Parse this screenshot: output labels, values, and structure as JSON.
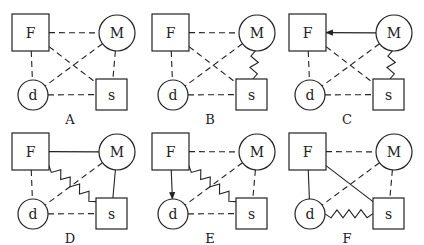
{
  "colors": {
    "ink": "#222222",
    "background": "#ffffff"
  },
  "legend": {
    "edge_styles": [
      "dashed",
      "solid",
      "zigzag",
      "arrow"
    ]
  },
  "nodes": {
    "F": {
      "label": "F",
      "shape": "square",
      "x": 12,
      "y": 14,
      "w": 37,
      "h": 37
    },
    "M": {
      "label": "M",
      "shape": "circle",
      "cx": 117,
      "cy": 33,
      "r": 18
    },
    "d": {
      "label": "d",
      "shape": "circle",
      "cx": 33,
      "cy": 95,
      "r": 15
    },
    "s": {
      "label": "s",
      "shape": "square",
      "x": 96,
      "y": 79,
      "w": 31,
      "h": 31
    }
  },
  "panels": [
    {
      "id": "A",
      "label": "A",
      "dx": 0,
      "dy": 0,
      "edges": [
        {
          "from": "F",
          "to": "M",
          "style": "dashed"
        },
        {
          "from": "F",
          "to": "d",
          "style": "dashed"
        },
        {
          "from": "F",
          "to": "s",
          "style": "dashed"
        },
        {
          "from": "M",
          "to": "d",
          "style": "dashed"
        },
        {
          "from": "M",
          "to": "s",
          "style": "dashed"
        },
        {
          "from": "d",
          "to": "s",
          "style": "dashed"
        }
      ]
    },
    {
      "id": "B",
      "label": "B",
      "dx": 140,
      "dy": 0,
      "edges": [
        {
          "from": "F",
          "to": "M",
          "style": "dashed"
        },
        {
          "from": "F",
          "to": "d",
          "style": "dashed"
        },
        {
          "from": "F",
          "to": "s",
          "style": "dashed"
        },
        {
          "from": "M",
          "to": "d",
          "style": "dashed"
        },
        {
          "from": "M",
          "to": "s",
          "style": "zigzag"
        },
        {
          "from": "d",
          "to": "s",
          "style": "dashed"
        }
      ]
    },
    {
      "id": "C",
      "label": "C",
      "dx": 277,
      "dy": 0,
      "edges": [
        {
          "from": "M",
          "to": "F",
          "style": "arrow"
        },
        {
          "from": "F",
          "to": "d",
          "style": "dashed"
        },
        {
          "from": "F",
          "to": "s",
          "style": "dashed"
        },
        {
          "from": "M",
          "to": "d",
          "style": "dashed"
        },
        {
          "from": "M",
          "to": "s",
          "style": "zigzag"
        },
        {
          "from": "d",
          "to": "s",
          "style": "dashed"
        }
      ]
    },
    {
      "id": "D",
      "label": "D",
      "dx": 0,
      "dy": 119,
      "edges": [
        {
          "from": "F",
          "to": "M",
          "style": "solid"
        },
        {
          "from": "F",
          "to": "d",
          "style": "dashed"
        },
        {
          "from": "F",
          "to": "s",
          "style": "zigzag"
        },
        {
          "from": "M",
          "to": "d",
          "style": "dashed"
        },
        {
          "from": "M",
          "to": "s",
          "style": "solid"
        },
        {
          "from": "d",
          "to": "s",
          "style": "dashed"
        }
      ]
    },
    {
      "id": "E",
      "label": "E",
      "dx": 140,
      "dy": 119,
      "edges": [
        {
          "from": "F",
          "to": "M",
          "style": "dashed"
        },
        {
          "from": "F",
          "to": "d",
          "style": "arrow"
        },
        {
          "from": "F",
          "to": "s",
          "style": "zigzag"
        },
        {
          "from": "M",
          "to": "d",
          "style": "dashed"
        },
        {
          "from": "M",
          "to": "s",
          "style": "dashed"
        },
        {
          "from": "d",
          "to": "s",
          "style": "dashed"
        }
      ]
    },
    {
      "id": "F",
      "label": "F",
      "dx": 277,
      "dy": 119,
      "edges": [
        {
          "from": "F",
          "to": "M",
          "style": "dashed"
        },
        {
          "from": "F",
          "to": "d",
          "style": "solid"
        },
        {
          "from": "F",
          "to": "s",
          "style": "solid"
        },
        {
          "from": "M",
          "to": "d",
          "style": "dashed"
        },
        {
          "from": "M",
          "to": "s",
          "style": "dashed"
        },
        {
          "from": "d",
          "to": "s",
          "style": "zigzag"
        }
      ]
    }
  ],
  "label_pos": {
    "x": 70,
    "y": 124
  }
}
